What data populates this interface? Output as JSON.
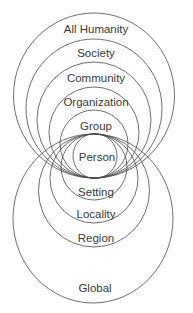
{
  "diagram": {
    "type": "nested-circles-bipolar",
    "center_label": "Person",
    "upper_levels": [
      {
        "label": "All Humanity",
        "cx": 94,
        "cy": 95.5,
        "rx": 80.5,
        "ry": 82.5,
        "label_y": 29
      },
      {
        "label": "Society",
        "cx": 94,
        "cy": 108.5,
        "rx": 68,
        "ry": 69.5,
        "label_y": 53
      },
      {
        "label": "Community",
        "cx": 94,
        "cy": 120,
        "rx": 57,
        "ry": 58,
        "label_y": 78
      },
      {
        "label": "Organization",
        "cx": 94,
        "cy": 132.5,
        "rx": 45,
        "ry": 45.5,
        "label_y": 102
      },
      {
        "label": "Group",
        "cx": 94,
        "cy": 144,
        "rx": 34,
        "ry": 34,
        "label_y": 126
      }
    ],
    "person": {
      "label": "Person",
      "cx": 95,
      "cy": 156,
      "rx": 22,
      "ry": 22.5,
      "label_y": 157
    },
    "lower_levels": [
      {
        "label": "Setting",
        "cx": 94,
        "cy": 167,
        "rx": 33,
        "ry": 33,
        "label_y": 192
      },
      {
        "label": "Locality",
        "cx": 94,
        "cy": 178.5,
        "rx": 44,
        "ry": 44.5,
        "label_y": 214
      },
      {
        "label": "Region",
        "cx": 94,
        "cy": 190.5,
        "rx": 55.5,
        "ry": 56.5,
        "label_y": 238
      },
      {
        "label": "Global",
        "cx": 93,
        "cy": 218.5,
        "rx": 80,
        "ry": 84.5,
        "label_y": 288
      }
    ],
    "colors": {
      "stroke": "#4a4a4a",
      "text": "#3a3a3a",
      "background": "#ffffff"
    }
  }
}
